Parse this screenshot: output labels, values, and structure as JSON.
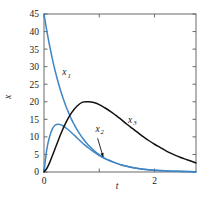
{
  "chart_data": {
    "type": "line",
    "title": "",
    "subtitle": "",
    "xlabel": "t",
    "ylabel": "x",
    "xlim": [
      0,
      2.75
    ],
    "ylim": [
      0,
      45
    ],
    "grid": false,
    "legend_position": "inline-annotations",
    "x_ticks": [
      0,
      1,
      2
    ],
    "x_tick_labels": [
      "0",
      "",
      "2"
    ],
    "y_ticks": [
      0,
      5,
      10,
      15,
      20,
      25,
      30,
      35,
      40,
      45
    ],
    "y_tick_labels": [
      "0",
      "5",
      "10",
      "15",
      "20",
      "25",
      "30",
      "35",
      "40",
      "45"
    ],
    "annotations": [
      {
        "text": "x",
        "sub": "1",
        "x": 0.33,
        "y": 27.5
      },
      {
        "text": "x",
        "sub": "2",
        "x": 0.93,
        "y": 11.5
      },
      {
        "text": "x",
        "sub": "3",
        "x": 1.52,
        "y": 14.0
      }
    ],
    "arrow": {
      "from_x": 0.97,
      "from_y": 9.6,
      "to_x": 1.07,
      "to_y": 4.3
    },
    "series": [
      {
        "name": "x1",
        "color": "#3f86c4",
        "style": "solid",
        "width": 1.5,
        "x": [
          0,
          0.05,
          0.1,
          0.15,
          0.2,
          0.25,
          0.3,
          0.35,
          0.4,
          0.45,
          0.5,
          0.55,
          0.6,
          0.7,
          0.8,
          0.9,
          1.0,
          1.1,
          1.2,
          1.4,
          1.6,
          1.8,
          2.0,
          2.2,
          2.4,
          2.75
        ],
        "y": [
          45,
          40.3,
          36.1,
          32.3,
          28.9,
          25.9,
          23.2,
          20.8,
          18.6,
          16.7,
          14.9,
          13.4,
          12.0,
          9.6,
          7.7,
          6.2,
          4.9,
          3.9,
          3.2,
          2.0,
          1.3,
          0.8,
          0.5,
          0.33,
          0.21,
          0.1
        ]
      },
      {
        "name": "x2",
        "color": "#3f86c4",
        "style": "solid",
        "width": 1.5,
        "x": [
          0,
          0.05,
          0.1,
          0.15,
          0.2,
          0.25,
          0.3,
          0.35,
          0.4,
          0.45,
          0.5,
          0.6,
          0.7,
          0.8,
          0.9,
          1.0,
          1.1,
          1.2,
          1.4,
          1.6,
          1.8,
          2.0,
          2.2,
          2.4,
          2.75
        ],
        "y": [
          0,
          6.4,
          10.0,
          12.2,
          13.3,
          13.6,
          13.5,
          13.1,
          12.5,
          11.9,
          11.2,
          9.7,
          8.2,
          6.9,
          5.7,
          4.7,
          3.8,
          3.1,
          2.0,
          1.3,
          0.8,
          0.5,
          0.32,
          0.2,
          0.09
        ]
      },
      {
        "name": "x3",
        "color": "#111111",
        "style": "solid",
        "width": 1.5,
        "x": [
          0,
          0.05,
          0.1,
          0.2,
          0.3,
          0.4,
          0.5,
          0.6,
          0.7,
          0.8,
          0.9,
          1.0,
          1.1,
          1.2,
          1.3,
          1.4,
          1.5,
          1.6,
          1.7,
          1.8,
          1.9,
          2.0,
          2.1,
          2.2,
          2.3,
          2.4,
          2.5,
          2.6,
          2.75
        ],
        "y": [
          0,
          1.0,
          2.6,
          6.6,
          10.7,
          14.2,
          16.9,
          18.8,
          19.9,
          20.0,
          19.8,
          19.2,
          18.3,
          17.3,
          16.1,
          14.9,
          13.6,
          12.4,
          11.2,
          10.0,
          8.9,
          7.9,
          7.0,
          6.1,
          5.3,
          4.6,
          4.0,
          3.4,
          2.6
        ]
      }
    ]
  },
  "axes": {
    "frame_color": "#5a5a5a",
    "background": "#ffffff"
  }
}
